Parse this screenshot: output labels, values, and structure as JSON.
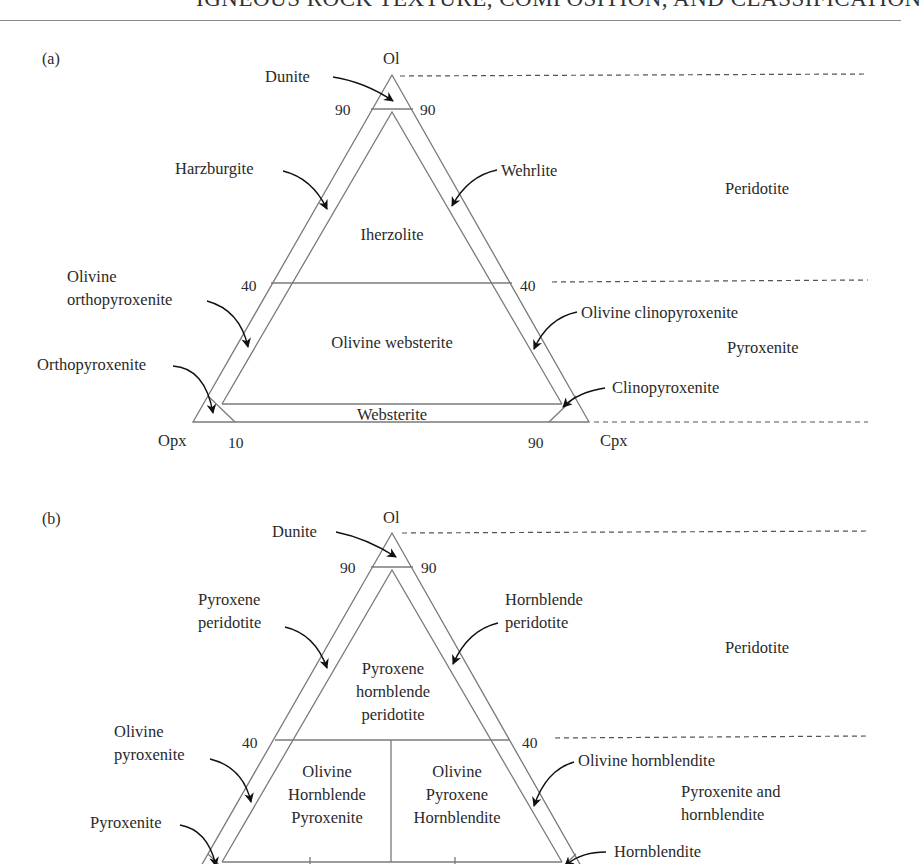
{
  "header": {
    "title": "IGNEOUS ROCK TEXTURE, COMPOSITION, AND CLASSIFICATION"
  },
  "panels": [
    {
      "id": "a",
      "panel_label": "(a)",
      "vertices": {
        "top": "Ol",
        "left": "Opx",
        "right": "Cpx"
      },
      "ticks": {
        "top_left": "90",
        "top_right": "90",
        "mid_left": "40",
        "mid_right": "40",
        "bottom_left": "10",
        "bottom_right": "90"
      },
      "fields": {
        "upper": "Iherzolite",
        "middle": "Olivine websterite",
        "bottom": "Websterite"
      },
      "callouts": {
        "apex": "Dunite",
        "upper_left": "Harzburgite",
        "upper_right": "Wehrlite",
        "mid_left_line1": "Olivine",
        "mid_left_line2": "orthopyroxenite",
        "mid_right": "Olivine clinopyroxenite",
        "corner_left": "Orthopyroxenite",
        "corner_right": "Clinopyroxenite"
      },
      "groups": {
        "upper": "Peridotite",
        "lower": "Pyroxenite"
      }
    },
    {
      "id": "b",
      "panel_label": "(b)",
      "vertices": {
        "top": "Ol"
      },
      "ticks": {
        "top_left": "90",
        "top_right": "90",
        "mid_left": "40",
        "mid_right": "40"
      },
      "fields": {
        "upper": [
          "Pyroxene",
          "hornblende",
          "peridotite"
        ],
        "middle_left": [
          "Olivine",
          "Hornblende",
          "Pyroxenite"
        ],
        "middle_right": [
          "Olivine",
          "Pyroxene",
          "Hornblendite"
        ]
      },
      "callouts": {
        "apex": "Dunite",
        "upper_left": [
          "Pyroxene",
          "peridotite"
        ],
        "upper_right": [
          "Hornblende",
          "peridotite"
        ],
        "mid_left": [
          "Olivine",
          "pyroxenite"
        ],
        "mid_right": "Olivine hornblendite",
        "corner_left": "Pyroxenite",
        "corner_right": "Hornblendite"
      },
      "groups": {
        "upper": "Peridotite",
        "lower": [
          "Pyroxenite and",
          "hornblendite"
        ]
      }
    }
  ],
  "colors": {
    "line": "#7a7a7a",
    "arrow": "#111111",
    "text": "#2a2a2a"
  }
}
